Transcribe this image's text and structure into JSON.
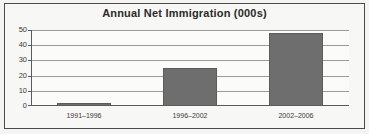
{
  "chart_data": {
    "type": "bar",
    "title": "Annual Net Immigration (000s)",
    "xlabel": "",
    "ylabel": "",
    "categories": [
      "1991–1996",
      "1996–2002",
      "2002–2006"
    ],
    "values": [
      2,
      25,
      48
    ],
    "series": [
      {
        "name": "Annual Net Immigration (000s)",
        "values": [
          2,
          25,
          48
        ]
      }
    ],
    "ylim": [
      0,
      50
    ],
    "yticks": [
      0,
      10,
      20,
      30,
      40,
      50
    ],
    "ytick_labels": [
      "0",
      "10",
      "20",
      "30",
      "40",
      "50"
    ],
    "grid": true,
    "legend": false,
    "legend_position": "none",
    "bar_color": "#6e6e6e",
    "background_color": "#fbfbfa",
    "frame_color": "#4b4b4b",
    "title_color": "#2a2a2a"
  }
}
